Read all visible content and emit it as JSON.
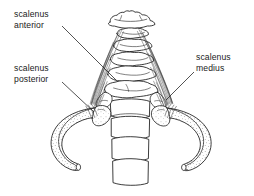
{
  "figure": {
    "kind": "anatomical-line-drawing",
    "background_color": "#ffffff",
    "ink_color": "#1a1a1a",
    "width": 254,
    "height": 196
  },
  "labels": {
    "anterior": {
      "line1": "scalenus",
      "line2": "anterior"
    },
    "posterior": {
      "line1": "scalenus",
      "line2": "posterior"
    },
    "medius": {
      "line1": "scalenus",
      "line2": "medius"
    }
  }
}
